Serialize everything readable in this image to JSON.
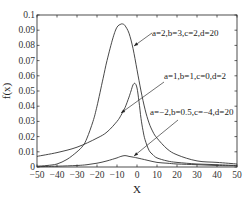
{
  "chart_data": {
    "type": "line",
    "title": "",
    "xlabel": "X",
    "ylabel": "f(x)",
    "xlim": [
      -50,
      50
    ],
    "ylim": [
      0,
      0.1
    ],
    "grid": false,
    "legend": "none (inline annotations with arrows)",
    "x_ticks": [
      -50,
      -40,
      -30,
      -20,
      -10,
      0,
      10,
      20,
      30,
      40,
      50
    ],
    "x_tick_labels": [
      "-50",
      "-40",
      "-30",
      "-20",
      "-10",
      "0",
      "10",
      "20",
      "30",
      "40",
      "50"
    ],
    "y_ticks": [
      0,
      0.01,
      0.02,
      0.03,
      0.04,
      0.05,
      0.06,
      0.07,
      0.08,
      0.09,
      0.1
    ],
    "y_tick_labels": [
      "0",
      "0.01",
      "0.02",
      "0.03",
      "0.04",
      "0.05",
      "0.06",
      "0.07",
      "0.08",
      "0.09",
      "0.1"
    ],
    "series": [
      {
        "name": "a=2,b=3,c=2,d=20",
        "x": [
          -50,
          -45,
          -40,
          -35,
          -30,
          -27,
          -25,
          -22,
          -20,
          -17,
          -15,
          -12,
          -10,
          -8,
          -7,
          -6,
          -4,
          -2,
          0,
          2,
          4,
          6,
          8,
          10,
          15,
          20,
          30,
          40,
          50
        ],
        "y": [
          0.0005,
          0.001,
          0.002,
          0.005,
          0.01,
          0.014,
          0.019,
          0.03,
          0.04,
          0.058,
          0.07,
          0.085,
          0.092,
          0.094,
          0.094,
          0.093,
          0.088,
          0.078,
          0.064,
          0.05,
          0.038,
          0.029,
          0.023,
          0.019,
          0.012,
          0.008,
          0.004,
          0.003,
          0.002
        ]
      },
      {
        "name": "a=1,b=1,c=0,d=2",
        "x": [
          -50,
          -40,
          -30,
          -20,
          -15,
          -10,
          -8,
          -6,
          -4,
          -3,
          -2,
          -1,
          0,
          1,
          2,
          3,
          4,
          6,
          8,
          10,
          15,
          20,
          30,
          40,
          50
        ],
        "y": [
          0.007,
          0.0095,
          0.013,
          0.019,
          0.023,
          0.03,
          0.034,
          0.039,
          0.046,
          0.05,
          0.054,
          0.055,
          0.052,
          0.043,
          0.032,
          0.024,
          0.018,
          0.011,
          0.008,
          0.006,
          0.004,
          0.003,
          0.002,
          0.0015,
          0.001
        ]
      },
      {
        "name": "a=-2,b=0.5,c=-4,d=20",
        "x": [
          -50,
          -40,
          -30,
          -25,
          -20,
          -15,
          -10,
          -8,
          -6,
          -4,
          -2,
          0,
          5,
          10,
          15,
          20,
          30,
          40,
          50
        ],
        "y": [
          0.0002,
          0.0005,
          0.001,
          0.0015,
          0.0025,
          0.004,
          0.006,
          0.007,
          0.0075,
          0.007,
          0.0065,
          0.006,
          0.0045,
          0.003,
          0.0025,
          0.002,
          0.0015,
          0.001,
          0.0008
        ]
      }
    ],
    "annotations": [
      {
        "text": "a=2,b=3,c=2,d=20",
        "text_x": 152,
        "text_y": 36,
        "arrow_from": [
          152,
          33
        ],
        "arrow_to": [
          134,
          46
        ]
      },
      {
        "text": "a=1,b=1,c=0,d=2",
        "text_x": 164,
        "text_y": 79,
        "arrow_from": [
          164,
          82
        ],
        "arrow_to": [
          121,
          113
        ]
      },
      {
        "text": "a=-2,b=0.5,c=-4,d=20",
        "text_x": 150,
        "text_y": 115,
        "arrow_from": [
          178,
          120
        ],
        "arrow_to": [
          134,
          156
        ]
      }
    ]
  }
}
